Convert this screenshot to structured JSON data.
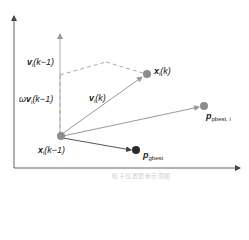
{
  "diagram": {
    "type": "pso-velocity-update-vector-diagram",
    "labels": {
      "v_prev": "v",
      "v_prev_sub": "i",
      "v_prev_arg": "(k−1)",
      "omega_v_prefix": "ω",
      "omega_v": "v",
      "omega_v_sub": "i",
      "omega_v_arg": "(k−1)",
      "v_curr": "v",
      "v_curr_sub": "i",
      "v_curr_arg": "(k)",
      "x_curr": "x",
      "x_curr_sub": "i",
      "x_curr_arg": "(k)",
      "x_prev": "x",
      "x_prev_sub": "i",
      "x_prev_arg": "(k−1)",
      "pbest": "p",
      "pbest_sub": "pbest, i",
      "gbest": "p",
      "gbest_sub": "gbest"
    },
    "caption": "粒子位置更新示意图",
    "colors": {
      "axis": "#555555",
      "vector": "#999999",
      "dashed": "#999999",
      "node_gray": "#8c8c8c",
      "node_dark": "#2a2a2a"
    }
  }
}
